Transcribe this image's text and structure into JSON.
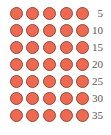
{
  "figure": {
    "type": "dot-array",
    "columns": 5,
    "rows": 7,
    "total": 35,
    "dot_color": "#f0684f",
    "dot_outline_color": "#8a4a3c",
    "label_color": "#555555"
  },
  "rows": [
    {
      "count_in_row": 5,
      "label": "5"
    },
    {
      "count_in_row": 5,
      "label": "10"
    },
    {
      "count_in_row": 5,
      "label": "15"
    },
    {
      "count_in_row": 5,
      "label": "20"
    },
    {
      "count_in_row": 5,
      "label": "25"
    },
    {
      "count_in_row": 5,
      "label": "30"
    },
    {
      "count_in_row": 5,
      "label": "35"
    }
  ]
}
